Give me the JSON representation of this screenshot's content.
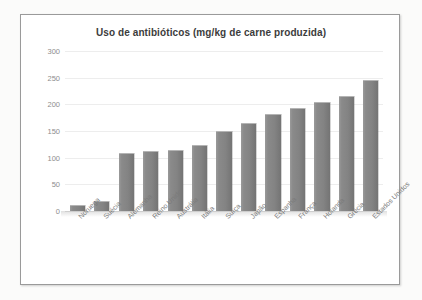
{
  "chart_data": {
    "type": "bar",
    "title": "Uso de antibióticos (mg/kg de carne produzida)",
    "xlabel": "",
    "ylabel": "",
    "ylim": [
      0,
      300
    ],
    "yticks": [
      0,
      50,
      100,
      150,
      200,
      250,
      300
    ],
    "grid": true,
    "legend": "none",
    "bar_color": "#878787",
    "categories": [
      "Noruega",
      "Suécia",
      "Alemanha",
      "Reino Unido",
      "Austrália",
      "Itália",
      "Suíça",
      "Japão",
      "Espanha",
      "França",
      "Holanda",
      "Grécia",
      "Estados Unidos"
    ],
    "values": [
      10,
      17,
      107,
      110,
      113,
      122,
      148,
      164,
      180,
      191,
      202,
      213,
      243
    ]
  }
}
